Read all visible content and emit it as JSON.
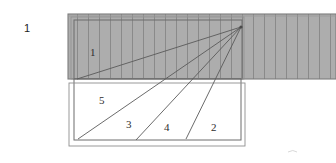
{
  "figure": {
    "name": "hatched-band-radiating-lines-diagram",
    "caption_number": "1",
    "colors": {
      "hatch_fill": "#adadad",
      "hatch_line": "#8a8a8a",
      "outline": "#6d6d6d",
      "ray_line": "#5a5a5a",
      "label_text": "#2e2e2e",
      "page_background": "#ffffff"
    },
    "labels": {
      "figure_index": "1",
      "region_top": "1",
      "region_5": "5",
      "region_3": "3",
      "region_4": "4",
      "region_2": "2"
    },
    "geometry": {
      "hatch_band": {
        "x": 68,
        "y": 14,
        "width": 268,
        "height": 65
      },
      "hatch_spacing": 11,
      "inner_outline": {
        "x": 74,
        "y": 20,
        "width": 168,
        "height": 53
      },
      "lower_rect_outer": {
        "x": 68,
        "y": 80,
        "width": 177,
        "height": 66
      },
      "lower_rect_inner": {
        "x": 73,
        "y": 77,
        "width": 168,
        "height": 63
      },
      "vertex": {
        "x": 241,
        "y": 27
      },
      "ray_endpoints": [
        {
          "name": "ray-to-left-mid",
          "x": 77,
          "y": 79
        },
        {
          "name": "ray-to-bottom-left",
          "x": 78,
          "y": 139
        },
        {
          "name": "ray-to-bottom-a",
          "x": 136,
          "y": 140
        },
        {
          "name": "ray-to-bottom-b",
          "x": 186,
          "y": 139
        }
      ]
    }
  }
}
